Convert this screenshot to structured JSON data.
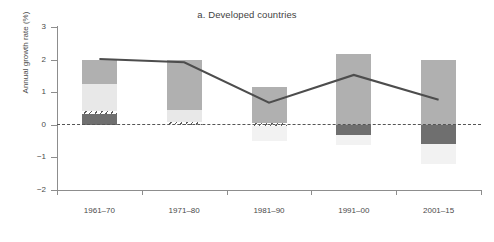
{
  "chart_data": {
    "type": "bar",
    "title": "a. Developed countries",
    "xlabel": "",
    "ylabel": "Annual growth rate (%)",
    "categories": [
      "1961–70",
      "1971–80",
      "1981–90",
      "1991–00",
      "2001–15"
    ],
    "ylim": [
      -2,
      3
    ],
    "yticks": [
      3,
      2,
      1,
      0,
      -1,
      -2
    ],
    "ytick_labels": [
      "3",
      "2",
      "1",
      "0",
      "−1",
      "−2"
    ],
    "grid": false,
    "legend": "none",
    "stacked_segments": [
      {
        "category": "1961–70",
        "segments": [
          {
            "style": "dark",
            "from": 0.0,
            "to": 0.33
          },
          {
            "style": "hatch",
            "from": 0.33,
            "to": 0.42
          },
          {
            "style": "light",
            "from": 0.42,
            "to": 1.25
          },
          {
            "style": "grey",
            "from": 1.25,
            "to": 2.0
          }
        ]
      },
      {
        "category": "1971–80",
        "segments": [
          {
            "style": "hatch",
            "from": 0.0,
            "to": 0.1
          },
          {
            "style": "light",
            "from": 0.1,
            "to": 0.45
          },
          {
            "style": "grey",
            "from": 0.45,
            "to": 2.0
          }
        ]
      },
      {
        "category": "1981–90",
        "segments": [
          {
            "style": "pale",
            "from": -0.5,
            "to": -0.04
          },
          {
            "style": "hatch",
            "from": -0.04,
            "to": 0.04
          },
          {
            "style": "grey",
            "from": 0.04,
            "to": 1.17
          }
        ]
      },
      {
        "category": "1991–00",
        "segments": [
          {
            "style": "pale",
            "from": -0.63,
            "to": -0.3
          },
          {
            "style": "dark",
            "from": -0.3,
            "to": 0.0
          },
          {
            "style": "grey",
            "from": 0.0,
            "to": 2.18
          }
        ]
      },
      {
        "category": "2001–15",
        "segments": [
          {
            "style": "pale",
            "from": -1.2,
            "to": -0.6
          },
          {
            "style": "dark",
            "from": -0.6,
            "to": 0.0
          },
          {
            "style": "grey",
            "from": 0.0,
            "to": 2.0
          }
        ]
      }
    ],
    "line_series": {
      "name": "total",
      "values": [
        2.02,
        1.92,
        0.68,
        1.53,
        0.77
      ],
      "color": "#4d4d4d"
    },
    "colors": {
      "grey": "#b0b0b0",
      "dark": "#6f6f6f",
      "light": "#e8e8e8",
      "pale": "#f2f2f2",
      "hatch_stroke": "#5d5d5d",
      "line": "#4d4d4d",
      "axis": "#8d8d8d",
      "zero_line": "#555555"
    }
  }
}
